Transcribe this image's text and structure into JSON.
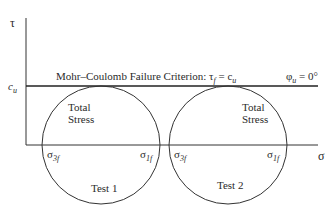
{
  "diagram": {
    "axes": {
      "y_label": "τ",
      "x_label": "σ",
      "cu_label": "c",
      "cu_sub": "u"
    },
    "criterion": {
      "text": "Mohr–Coulomb Failure Criterion: τ",
      "tau_sub": "f",
      "eq": " = c",
      "c_sub": "u"
    },
    "phi": {
      "symbol": "φ",
      "sub": "u",
      "value": " = 0°"
    },
    "circles": [
      {
        "name": "Test 1",
        "label1": "Total",
        "label2": "Stress",
        "s3": "σ",
        "s3_sub": "3f",
        "s1": "σ",
        "s1_sub": "1f"
      },
      {
        "name": "Test 2",
        "label1": "Total",
        "label2": "Stress",
        "s3": "σ",
        "s3_sub": "3f",
        "s1": "σ",
        "s1_sub": "1f"
      }
    ]
  }
}
